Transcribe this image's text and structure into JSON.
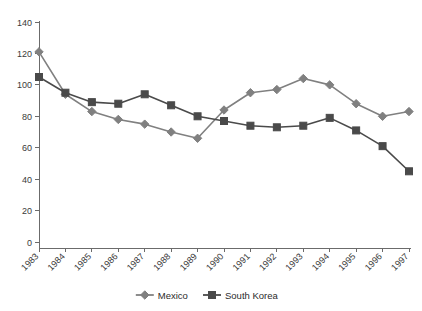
{
  "chart_data": {
    "type": "line",
    "title": "",
    "xlabel": "",
    "ylabel": "",
    "categories": [
      "1983",
      "1984",
      "1985",
      "1986",
      "1987",
      "1988",
      "1989",
      "1990",
      "1991",
      "1992",
      "1993",
      "1994",
      "1995",
      "1996",
      "1997"
    ],
    "series": [
      {
        "name": "Mexico",
        "marker": "diamond",
        "color": "#808080",
        "values": [
          121,
          94,
          83,
          78,
          75,
          70,
          66,
          84,
          95,
          97,
          104,
          100,
          88,
          80,
          83
        ]
      },
      {
        "name": "South Korea",
        "marker": "square",
        "color": "#4a4a4a",
        "values": [
          105,
          95,
          89,
          88,
          94,
          87,
          80,
          77,
          74,
          73,
          74,
          79,
          71,
          61,
          45
        ]
      }
    ],
    "ylim": [
      0,
      140
    ],
    "yticks": [
      0,
      20,
      40,
      60,
      80,
      100,
      120,
      140
    ],
    "ytick_labels": [
      "0",
      "20",
      "40",
      "60",
      "80",
      "100",
      "120",
      "140"
    ],
    "grid": false,
    "legend_position": "bottom",
    "xtick_rotation": -45
  },
  "legend": {
    "items": [
      {
        "label": "Mexico",
        "marker": "diamond",
        "color": "#808080"
      },
      {
        "label": "South Korea",
        "marker": "square",
        "color": "#4a4a4a"
      }
    ]
  },
  "colors": {
    "axis": "#6b6b6b",
    "text": "#2b2b2b",
    "background": "#ffffff",
    "mexico": "#808080",
    "south_korea": "#4a4a4a"
  }
}
